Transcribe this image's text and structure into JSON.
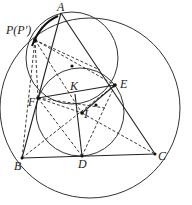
{
  "figure": {
    "type": "geometry-diagram",
    "labels": {
      "A": "A",
      "P": "P(P′)",
      "E": "E",
      "F": "F",
      "K": "K",
      "I": "I",
      "B": "B",
      "D": "D",
      "C": "C"
    },
    "points": [
      "A",
      "P",
      "E",
      "F",
      "K",
      "I",
      "B",
      "D",
      "C"
    ],
    "circles": [
      "circumcircle-ABC",
      "incircle-DEF",
      "circle-APFE"
    ],
    "solid_segments": [
      [
        "A",
        "B"
      ],
      [
        "A",
        "C"
      ],
      [
        "B",
        "C"
      ],
      [
        "A",
        "D"
      ],
      [
        "F",
        "E"
      ],
      [
        "K",
        "I"
      ],
      [
        "I",
        "D"
      ]
    ],
    "dashed_segments": [
      [
        "P",
        "F"
      ],
      [
        "P",
        "B"
      ],
      [
        "P",
        "D"
      ],
      [
        "P",
        "E"
      ],
      [
        "P",
        "I"
      ],
      [
        "F",
        "I"
      ],
      [
        "B",
        "E"
      ],
      [
        "B",
        "I"
      ],
      [
        "I",
        "C"
      ],
      [
        "I",
        "E"
      ],
      [
        "D",
        "E"
      ],
      [
        "F",
        "D"
      ]
    ]
  }
}
